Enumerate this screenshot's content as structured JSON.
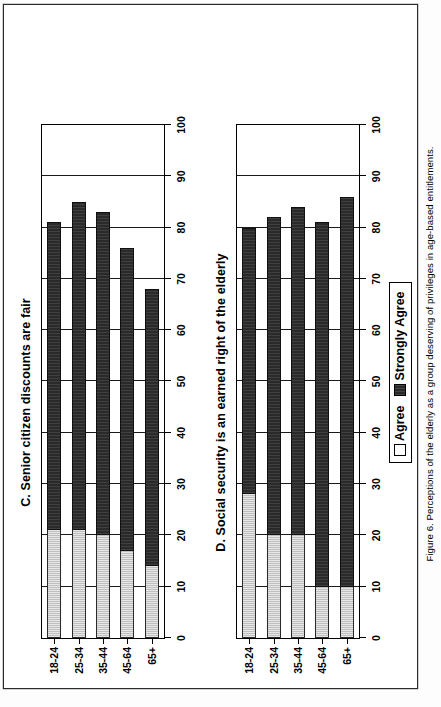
{
  "figure": {
    "caption": "Figure 6.  Perceptions of the elderly as a group deserving of privileges in age-based entitlements."
  },
  "legend": {
    "items": [
      {
        "label": "Agree",
        "color": "#ffffff"
      },
      {
        "label": "Strongly Agree",
        "color": "#2a2a2a"
      }
    ]
  },
  "chart_data": [
    {
      "id": "C",
      "type": "bar",
      "orientation": "horizontal",
      "stacked": true,
      "title": "C. Senior citizen discounts are fair",
      "categories": [
        "18-24",
        "25-34",
        "35-44",
        "45-64",
        "65+"
      ],
      "series": [
        {
          "name": "Agree",
          "values": [
            21,
            21,
            20,
            17,
            14
          ]
        },
        {
          "name": "Strongly Agree",
          "values": [
            60,
            64,
            63,
            59,
            54
          ]
        }
      ],
      "totals": [
        81,
        85,
        83,
        76,
        68
      ],
      "xlabel": "",
      "ylabel": "",
      "xlim": [
        0,
        100
      ],
      "xticks": [
        0,
        10,
        20,
        30,
        40,
        50,
        60,
        70,
        80,
        90,
        100
      ],
      "grid": true,
      "legend_position": "below"
    },
    {
      "id": "D",
      "type": "bar",
      "orientation": "horizontal",
      "stacked": true,
      "title": "D. Social security is an earned right of the elderly",
      "categories": [
        "18-24",
        "25-34",
        "35-44",
        "45-64",
        "65+"
      ],
      "series": [
        {
          "name": "Agree",
          "values": [
            28,
            20,
            20,
            10,
            10
          ]
        },
        {
          "name": "Strongly Agree",
          "values": [
            52,
            62,
            64,
            71,
            76
          ]
        }
      ],
      "totals": [
        80,
        82,
        84,
        81,
        86
      ],
      "xlabel": "",
      "ylabel": "",
      "xlim": [
        0,
        100
      ],
      "xticks": [
        0,
        10,
        20,
        30,
        40,
        50,
        60,
        70,
        80,
        90,
        100
      ],
      "grid": true,
      "legend_position": "below"
    }
  ]
}
